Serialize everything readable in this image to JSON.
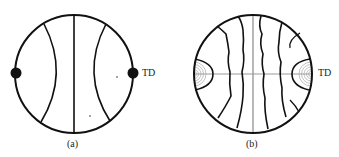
{
  "figure": {
    "panels": [
      {
        "id": "a",
        "caption": "(a)",
        "direction_label": "TD"
      },
      {
        "id": "b",
        "caption": "(b)",
        "direction_label": "TD"
      }
    ],
    "colors": {
      "stroke": "#111111",
      "axis_grey": "#9a9a9a",
      "contour_grey": "#a8a8a8",
      "background": "#ffffff"
    }
  }
}
